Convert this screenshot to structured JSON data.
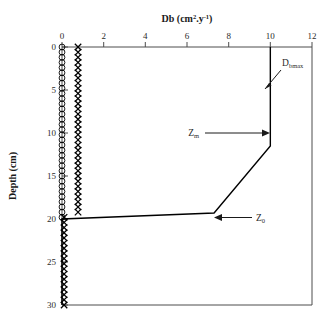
{
  "chart_data": {
    "type": "line",
    "title": "Db (cm2.y-1)",
    "title_display": "Db (cm².y⁻¹)",
    "xlabel": "Db (cm2.y-1)",
    "ylabel": "Depth (cm)",
    "xlim": [
      0,
      12
    ],
    "ylim": [
      0,
      30
    ],
    "y_inverted": true,
    "grid": false,
    "legend": false,
    "xticks": [
      0,
      2,
      4,
      6,
      8,
      10,
      12
    ],
    "xtick_labels": [
      "0",
      "2",
      "4",
      "6",
      "8",
      "10",
      "12"
    ],
    "yticks": [
      0,
      5,
      10,
      15,
      20,
      25,
      30
    ],
    "ytick_labels": [
      "0",
      "5",
      "10",
      "15",
      "20",
      "25",
      "30"
    ],
    "annotations": [
      {
        "name": "Dbmax",
        "text": "Dbmax",
        "base": "D",
        "sub": "bmax",
        "x": 11.0,
        "y": 2.2,
        "points_to_x": 10.0,
        "points_to_y": 6.0
      },
      {
        "name": "Zm",
        "text": "Zm",
        "base": "Z",
        "sub": "m",
        "x": 6.6,
        "y": 10.2,
        "points_to_x": 10.0,
        "points_to_y": 11.5
      },
      {
        "name": "Z0",
        "text": "Z0",
        "base": "Z",
        "sub": "0",
        "x": 9.3,
        "y": 19.8,
        "points_to_x": 7.3,
        "points_to_y": 19.3
      }
    ],
    "series": [
      {
        "name": "Db profile",
        "style": "line",
        "marker": "none",
        "color": "#000000",
        "points": [
          {
            "x": 10.0,
            "y": 0.0
          },
          {
            "x": 10.0,
            "y": 11.5
          },
          {
            "x": 7.3,
            "y": 19.3
          },
          {
            "x": 0.0,
            "y": 20.0
          },
          {
            "x": 0.0,
            "y": 30.0
          }
        ]
      },
      {
        "name": "open-circle series",
        "style": "markers",
        "marker": "circle-open",
        "color": "#000000",
        "x_value": 0.0,
        "y_start": 0.0,
        "y_end": 30.0,
        "y_step": 0.6,
        "points": [
          {
            "x": 0.0,
            "y": 0.0
          },
          {
            "x": 0.0,
            "y": 0.6
          },
          {
            "x": 0.0,
            "y": 1.2
          },
          {
            "x": 0.0,
            "y": 1.8
          },
          {
            "x": 0.0,
            "y": 2.4
          },
          {
            "x": 0.0,
            "y": 3.0
          },
          {
            "x": 0.0,
            "y": 3.6
          },
          {
            "x": 0.0,
            "y": 4.2
          },
          {
            "x": 0.0,
            "y": 4.8
          },
          {
            "x": 0.0,
            "y": 5.4
          },
          {
            "x": 0.0,
            "y": 6.0
          },
          {
            "x": 0.0,
            "y": 6.6
          },
          {
            "x": 0.0,
            "y": 7.2
          },
          {
            "x": 0.0,
            "y": 7.8
          },
          {
            "x": 0.0,
            "y": 8.4
          },
          {
            "x": 0.0,
            "y": 9.0
          },
          {
            "x": 0.0,
            "y": 9.6
          },
          {
            "x": 0.0,
            "y": 10.2
          },
          {
            "x": 0.0,
            "y": 10.8
          },
          {
            "x": 0.0,
            "y": 11.4
          },
          {
            "x": 0.0,
            "y": 12.0
          },
          {
            "x": 0.0,
            "y": 12.6
          },
          {
            "x": 0.0,
            "y": 13.2
          },
          {
            "x": 0.0,
            "y": 13.8
          },
          {
            "x": 0.0,
            "y": 14.4
          },
          {
            "x": 0.0,
            "y": 15.0
          },
          {
            "x": 0.0,
            "y": 15.6
          },
          {
            "x": 0.0,
            "y": 16.2
          },
          {
            "x": 0.0,
            "y": 16.8
          },
          {
            "x": 0.0,
            "y": 17.4
          },
          {
            "x": 0.0,
            "y": 18.0
          },
          {
            "x": 0.0,
            "y": 18.6
          },
          {
            "x": 0.0,
            "y": 19.2
          },
          {
            "x": 0.0,
            "y": 19.8
          }
        ]
      },
      {
        "name": "x-marker series",
        "style": "markers",
        "marker": "x",
        "color": "#000000",
        "x_value_upper": 0.77,
        "x_value_lower": 0.1,
        "y_start": 0.0,
        "y_end": 30.0,
        "y_step": 0.6,
        "points": [
          {
            "x": 0.77,
            "y": 0.0
          },
          {
            "x": 0.77,
            "y": 0.6
          },
          {
            "x": 0.77,
            "y": 1.2
          },
          {
            "x": 0.77,
            "y": 1.8
          },
          {
            "x": 0.77,
            "y": 2.4
          },
          {
            "x": 0.77,
            "y": 3.0
          },
          {
            "x": 0.77,
            "y": 3.6
          },
          {
            "x": 0.77,
            "y": 4.2
          },
          {
            "x": 0.77,
            "y": 4.8
          },
          {
            "x": 0.77,
            "y": 5.4
          },
          {
            "x": 0.77,
            "y": 6.0
          },
          {
            "x": 0.77,
            "y": 6.6
          },
          {
            "x": 0.77,
            "y": 7.2
          },
          {
            "x": 0.77,
            "y": 7.8
          },
          {
            "x": 0.77,
            "y": 8.4
          },
          {
            "x": 0.77,
            "y": 9.0
          },
          {
            "x": 0.77,
            "y": 9.6
          },
          {
            "x": 0.77,
            "y": 10.2
          },
          {
            "x": 0.77,
            "y": 10.8
          },
          {
            "x": 0.77,
            "y": 11.4
          },
          {
            "x": 0.77,
            "y": 12.0
          },
          {
            "x": 0.77,
            "y": 12.6
          },
          {
            "x": 0.77,
            "y": 13.2
          },
          {
            "x": 0.77,
            "y": 13.8
          },
          {
            "x": 0.77,
            "y": 14.4
          },
          {
            "x": 0.77,
            "y": 15.0
          },
          {
            "x": 0.77,
            "y": 15.6
          },
          {
            "x": 0.77,
            "y": 16.2
          },
          {
            "x": 0.77,
            "y": 16.8
          },
          {
            "x": 0.77,
            "y": 17.4
          },
          {
            "x": 0.77,
            "y": 18.0
          },
          {
            "x": 0.77,
            "y": 18.6
          },
          {
            "x": 0.77,
            "y": 19.2
          },
          {
            "x": 0.1,
            "y": 19.8
          },
          {
            "x": 0.1,
            "y": 20.4
          },
          {
            "x": 0.1,
            "y": 21.0
          },
          {
            "x": 0.1,
            "y": 21.6
          },
          {
            "x": 0.1,
            "y": 22.2
          },
          {
            "x": 0.1,
            "y": 22.8
          },
          {
            "x": 0.1,
            "y": 23.4
          },
          {
            "x": 0.1,
            "y": 24.0
          },
          {
            "x": 0.1,
            "y": 24.6
          },
          {
            "x": 0.1,
            "y": 25.2
          },
          {
            "x": 0.1,
            "y": 25.8
          },
          {
            "x": 0.1,
            "y": 26.4
          },
          {
            "x": 0.1,
            "y": 27.0
          },
          {
            "x": 0.1,
            "y": 27.6
          },
          {
            "x": 0.1,
            "y": 28.2
          },
          {
            "x": 0.1,
            "y": 28.8
          },
          {
            "x": 0.1,
            "y": 29.4
          },
          {
            "x": 0.1,
            "y": 30.0
          }
        ]
      }
    ]
  },
  "colors": {
    "axis": "#4d4d4d",
    "data": "#000000",
    "text": "#2b2b2b",
    "background": "#ffffff"
  }
}
